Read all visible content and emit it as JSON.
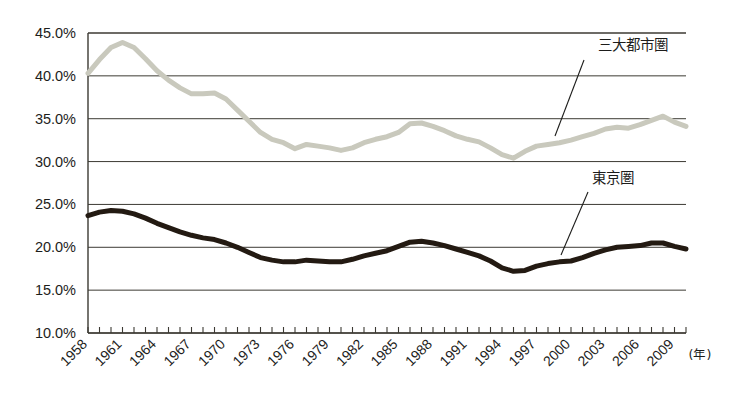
{
  "chart_data": {
    "type": "line",
    "title": "",
    "subtitle": "",
    "xlabel": "(年)",
    "ylabel": "",
    "ylim": [
      10.0,
      45.0
    ],
    "ytick_step": 5.0,
    "ytick_labels": [
      "10.0%",
      "15.0%",
      "20.0%",
      "25.0%",
      "30.0%",
      "35.0%",
      "40.0%",
      "45.0%"
    ],
    "ytick_values": [
      10.0,
      15.0,
      20.0,
      25.0,
      30.0,
      35.0,
      40.0,
      45.0
    ],
    "grid": true,
    "grid_axis": "y",
    "legend": "annotations",
    "xlim": [
      1958,
      2010
    ],
    "xtick_labels": [
      "1958",
      "1961",
      "1964",
      "1967",
      "1970",
      "1973",
      "1976",
      "1979",
      "1982",
      "1985",
      "1988",
      "1991",
      "1994",
      "1997",
      "2000",
      "2003",
      "2006",
      "2009"
    ],
    "xtick_label_values": [
      1958,
      1961,
      1964,
      1967,
      1970,
      1973,
      1976,
      1979,
      1982,
      1985,
      1988,
      1991,
      1994,
      1997,
      2000,
      2003,
      2006,
      2009
    ],
    "x": [
      1958,
      1959,
      1960,
      1961,
      1962,
      1963,
      1964,
      1965,
      1966,
      1967,
      1968,
      1969,
      1970,
      1971,
      1972,
      1973,
      1974,
      1975,
      1976,
      1977,
      1978,
      1979,
      1980,
      1981,
      1982,
      1983,
      1984,
      1985,
      1986,
      1987,
      1988,
      1989,
      1990,
      1991,
      1992,
      1993,
      1994,
      1995,
      1996,
      1997,
      1998,
      1999,
      2000,
      2001,
      2002,
      2003,
      2004,
      2005,
      2006,
      2007,
      2008,
      2009,
      2010
    ],
    "series": [
      {
        "name": "三大都市圏",
        "color": "#c9c9bd",
        "line_width": 5,
        "values": [
          40.3,
          41.9,
          43.3,
          43.9,
          43.3,
          42.0,
          40.6,
          39.5,
          38.6,
          37.9,
          37.9,
          38.0,
          37.3,
          36.0,
          34.7,
          33.4,
          32.6,
          32.2,
          31.5,
          32.0,
          31.8,
          31.6,
          31.3,
          31.6,
          32.2,
          32.6,
          32.9,
          33.4,
          34.4,
          34.5,
          34.1,
          33.6,
          33.0,
          32.6,
          32.3,
          31.6,
          30.8,
          30.4,
          31.2,
          31.8,
          32.0,
          32.2,
          32.5,
          32.9,
          33.3,
          33.8,
          34.0,
          33.9,
          34.3,
          34.8,
          35.3,
          34.6,
          34.1
        ]
      },
      {
        "name": "東京圏",
        "color": "#231a12",
        "line_width": 5,
        "values": [
          23.7,
          24.1,
          24.3,
          24.2,
          23.9,
          23.4,
          22.8,
          22.3,
          21.8,
          21.4,
          21.1,
          20.9,
          20.5,
          20.0,
          19.4,
          18.8,
          18.5,
          18.3,
          18.3,
          18.5,
          18.4,
          18.3,
          18.3,
          18.6,
          19.0,
          19.3,
          19.6,
          20.1,
          20.6,
          20.7,
          20.5,
          20.2,
          19.8,
          19.4,
          19.0,
          18.4,
          17.6,
          17.2,
          17.3,
          17.8,
          18.1,
          18.3,
          18.4,
          18.8,
          19.3,
          19.7,
          20.0,
          20.1,
          20.2,
          20.5,
          20.5,
          20.1,
          19.8
        ]
      }
    ],
    "annotations": [
      {
        "name": "三大都市圏",
        "text": "三大都市圏",
        "label_x": 598,
        "label_y": 50,
        "leader_from_x": 584,
        "leader_from_y": 60,
        "leader_to_x": 555,
        "leader_to_y": 136
      },
      {
        "name": "東京圏",
        "text": "東京圏",
        "label_x": 592,
        "label_y": 183,
        "leader_from_x": 588,
        "leader_from_y": 192,
        "leader_to_x": 561,
        "leader_to_y": 255
      }
    ]
  },
  "axis": {
    "x_unit_label": "(年)",
    "y_tick_labels": [
      "45.0%",
      "40.0%",
      "35.0%",
      "30.0%",
      "25.0%",
      "20.0%",
      "15.0%",
      "10.0%"
    ]
  },
  "colors": {
    "series_three_major": "#c9c9bd",
    "series_tokyo": "#231a12",
    "grid": "#3c3a33",
    "axis": "#3c3a33",
    "text": "#1d1d1b",
    "background": "#ffffff"
  }
}
